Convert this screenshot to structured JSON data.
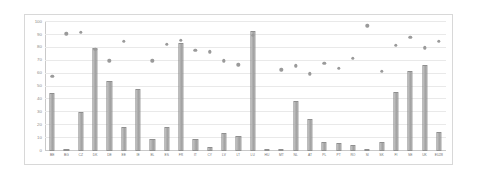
{
  "chart_data": {
    "type": "bar",
    "title": "",
    "subtitle": "",
    "xlabel": "",
    "ylabel": "",
    "ylim": [
      0,
      100
    ],
    "yticks": [
      0,
      10,
      20,
      30,
      40,
      50,
      60,
      70,
      80,
      90,
      100
    ],
    "grid": true,
    "legend": false,
    "legend_position": "none",
    "categories": [
      "BE",
      "BG",
      "CZ",
      "DK",
      "DE",
      "EE",
      "IE",
      "EL",
      "ES",
      "FR",
      "IT",
      "CY",
      "LV",
      "LT",
      "LU",
      "HU",
      "MT",
      "NL",
      "AT",
      "PL",
      "PT",
      "RO",
      "SI",
      "SK",
      "FI",
      "SE",
      "UK",
      "EU28"
    ],
    "series": [
      {
        "name": "bars",
        "type": "bar",
        "color": "#a9a9a9",
        "values": [
          45,
          0.5,
          30,
          80,
          54,
          19,
          48,
          9,
          19,
          84,
          9,
          3,
          14,
          12,
          93,
          0.5,
          0.5,
          39,
          25,
          7,
          6,
          5,
          1,
          7,
          46,
          62,
          67,
          15
        ]
      },
      {
        "name": "dots",
        "type": "scatter",
        "color": "#9a9a9a",
        "values": [
          58,
          91,
          92,
          79,
          70,
          85,
          null,
          70,
          83,
          86,
          78,
          77,
          70,
          67,
          90,
          null,
          63,
          66,
          60,
          68,
          64,
          72,
          97,
          62,
          82,
          88,
          80,
          85
        ]
      }
    ]
  }
}
